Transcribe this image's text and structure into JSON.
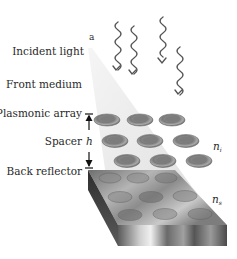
{
  "figure": {
    "panel_letter": "a",
    "labels": {
      "incident_light": "Incident light",
      "front_medium": "Front medium",
      "plasmonic_array": "Plasmonic array",
      "spacer": "Spacer",
      "back_reflector": "Back reflector",
      "height_symbol": "h",
      "index_spacer": "n",
      "index_spacer_sub": "i",
      "index_substrate": "n",
      "index_substrate_sub": "s"
    },
    "components": {
      "incident_waves": 4,
      "particle_rows": 3,
      "particles_per_row": 3,
      "reflector_particle_imprints": 9
    },
    "colors": {
      "light_cone": "#e6e6e6",
      "particle_outer": "#8a8a8a",
      "particle_inner": "#6a6a6a",
      "reflector_top": "#9a9a9a",
      "reflector_front": "#7a7a7a",
      "wave_stroke": "#555555"
    }
  }
}
